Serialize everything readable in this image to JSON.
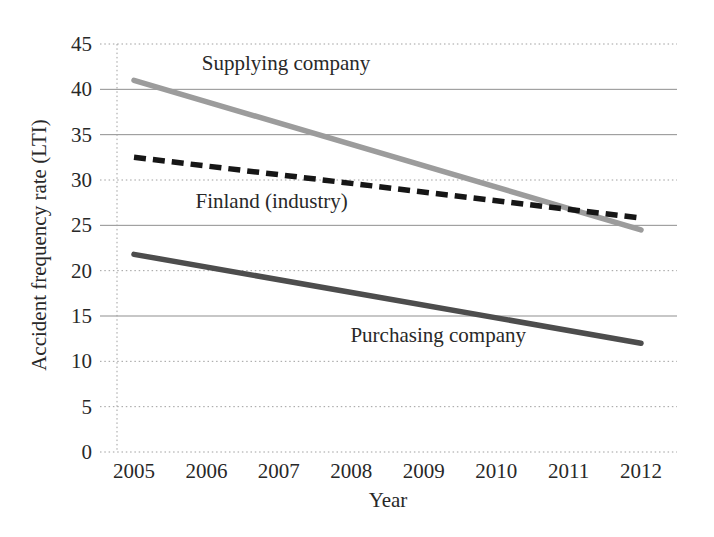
{
  "chart_data": {
    "type": "line",
    "title": "",
    "xlabel": "Year",
    "ylabel": "Accident frequency rate (LTI)",
    "x_ticks": [
      2005,
      2006,
      2007,
      2008,
      2009,
      2010,
      2011,
      2012
    ],
    "y_ticks": [
      0,
      5,
      10,
      15,
      20,
      25,
      30,
      35,
      40,
      45
    ],
    "xlim": [
      2005,
      2012
    ],
    "ylim": [
      0,
      45
    ],
    "grid": "horizontal",
    "legend_position": "inline-annotations",
    "series": [
      {
        "name": "Supplying company",
        "line_style": "solid",
        "color": "#9c9c9c",
        "x": [
          2005,
          2012
        ],
        "values": [
          41,
          24.5
        ]
      },
      {
        "name": "Finland (industry)",
        "line_style": "dashed",
        "color": "#161616",
        "x": [
          2005,
          2012
        ],
        "values": [
          32.5,
          25.8
        ]
      },
      {
        "name": "Purchasing company",
        "line_style": "solid",
        "color": "#4d4d4d",
        "x": [
          2005,
          2012
        ],
        "values": [
          21.8,
          12
        ]
      }
    ],
    "annotations": [
      {
        "text": "Supplying company",
        "anchor_x": 2007.1,
        "anchor_y": 42.9
      },
      {
        "text": "Finland (industry)",
        "anchor_x": 2006.9,
        "anchor_y": 27.7
      },
      {
        "text": "Purchasing company",
        "anchor_x": 2009.2,
        "anchor_y": 12.9
      }
    ]
  },
  "colors": {
    "background": "#ffffff",
    "text": "#282828",
    "grid_solid": "#8f8f8f",
    "grid_dotted": "#9f9f9f"
  }
}
